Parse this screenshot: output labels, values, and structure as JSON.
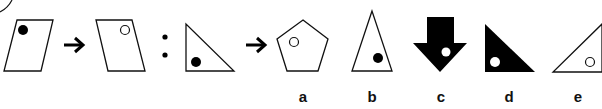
{
  "puzzle": {
    "type": "figure-analogy",
    "stroke_color": "#111111",
    "fill_color": "#000000",
    "background": "#ffffff",
    "premise": {
      "first": "parallelogram-with-filled-dot-top-left",
      "arrow_1": "→",
      "second": "mirrored-parallelogram-with-hollow-dot-top-right",
      "separator": ":",
      "third": "right-triangle-with-filled-dot-bottom-left",
      "arrow_2": "→"
    },
    "options": [
      {
        "label": "a",
        "shape": "pentagon-with-hollow-dot"
      },
      {
        "label": "b",
        "shape": "isosceles-triangle-with-filled-dot"
      },
      {
        "label": "c",
        "shape": "black-down-arrow-with-white-dot"
      },
      {
        "label": "d",
        "shape": "black-right-triangle-with-white-dot"
      },
      {
        "label": "e",
        "shape": "mirrored-right-triangle-with-hollow-dot"
      }
    ]
  }
}
